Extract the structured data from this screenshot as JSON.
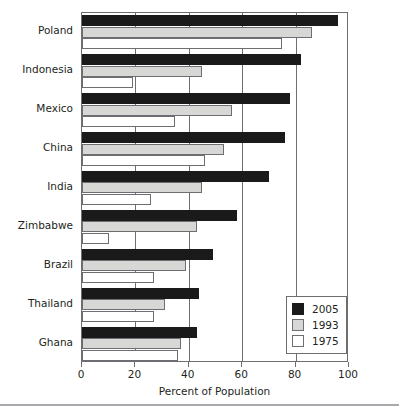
{
  "chart_data": {
    "type": "bar",
    "orientation": "horizontal",
    "title": "",
    "xlabel": "Percent of Population",
    "ylabel": "",
    "xlim": [
      0,
      100
    ],
    "xticks": [
      0,
      20,
      40,
      60,
      80,
      100
    ],
    "xticklabels": [
      "0",
      "20",
      "40",
      "60",
      "80",
      "100"
    ],
    "grid": true,
    "legend_position": "lower right",
    "categories": [
      "Poland",
      "Indonesia",
      "Mexico",
      "China",
      "India",
      "Zimbabwe",
      "Brazil",
      "Thailand",
      "Ghana"
    ],
    "series": [
      {
        "name": "2005",
        "color": "#1a1a1a",
        "values": [
          96,
          82,
          78,
          76,
          70,
          58,
          49,
          44,
          43
        ]
      },
      {
        "name": "1993",
        "color": "#d7d8d6",
        "values": [
          86,
          45,
          56,
          53,
          45,
          43,
          39,
          31,
          37
        ]
      },
      {
        "name": "1975",
        "color": "#ffffff",
        "values": [
          75,
          19,
          35,
          46,
          26,
          10,
          27,
          27,
          36
        ]
      }
    ]
  },
  "legend": {
    "entries": [
      {
        "label": "2005",
        "swatch": "black-swatch-icon"
      },
      {
        "label": "1993",
        "swatch": "gray-swatch-icon"
      },
      {
        "label": "1975",
        "swatch": "white-swatch-icon"
      }
    ]
  }
}
